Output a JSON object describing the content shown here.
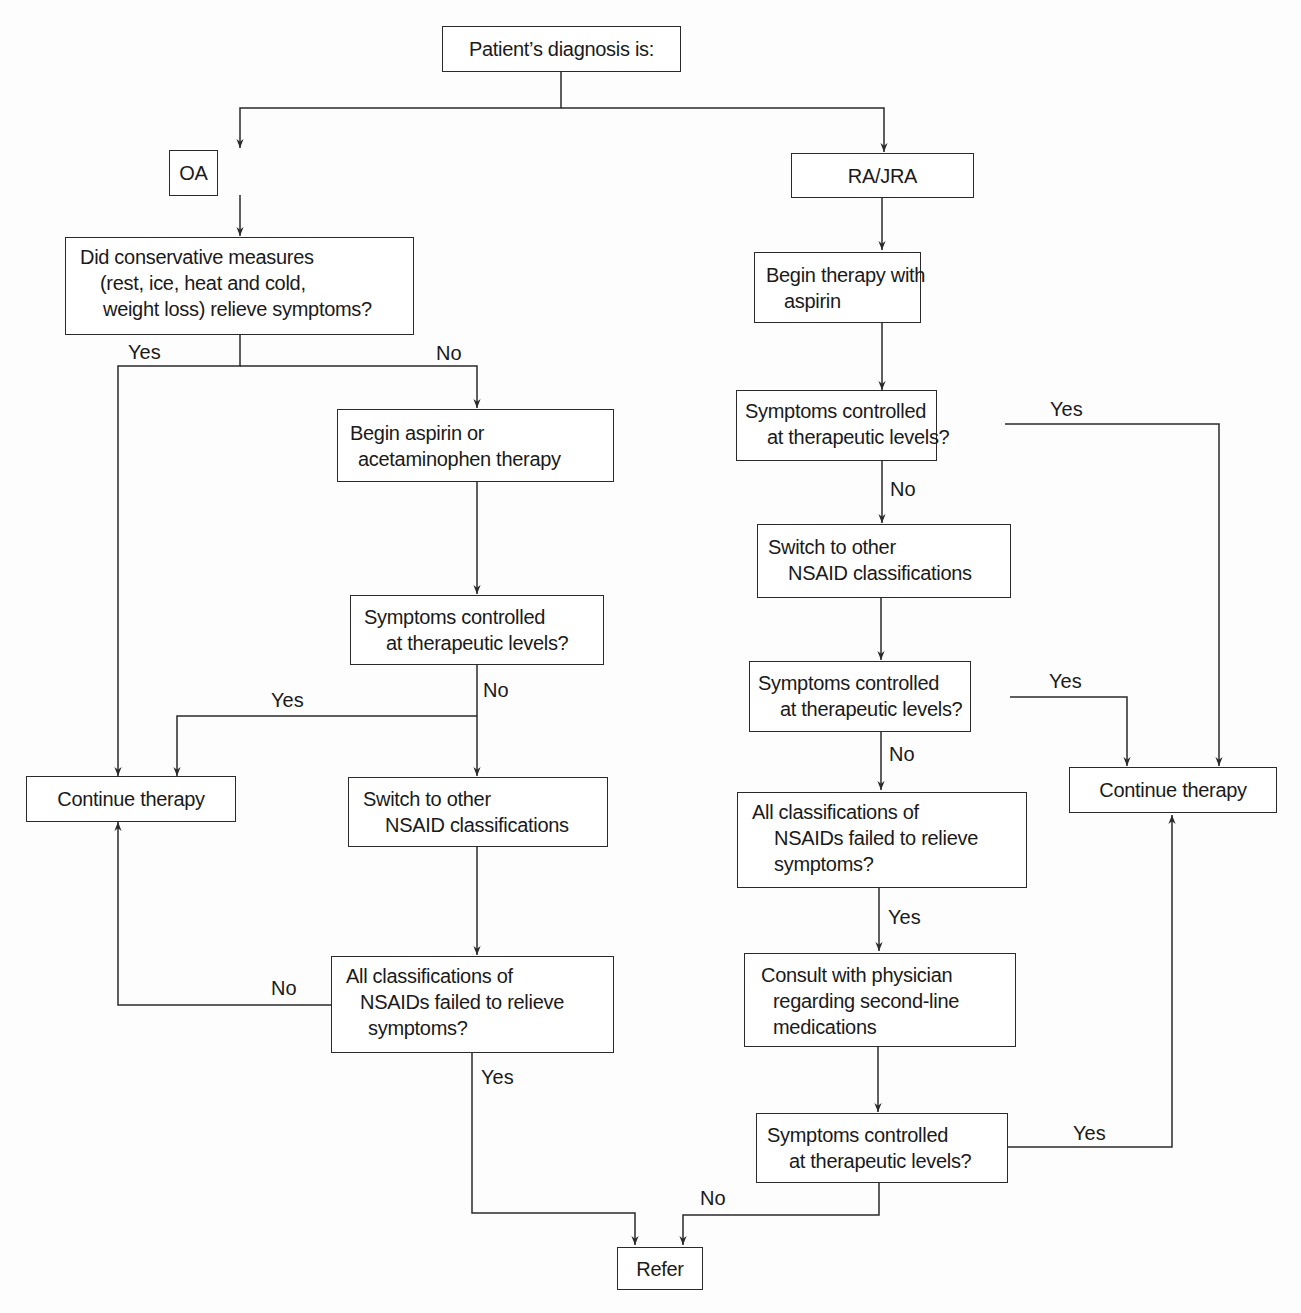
{
  "nodes": {
    "root": "Patient’s diagnosis is:",
    "oa": "OA",
    "ra": "RA/JRA",
    "oa_conservative": [
      "Did conservative measures",
      "(rest, ice, heat and cold,",
      "weight loss) relieve symptoms?"
    ],
    "oa_begin_aspirin": [
      "Begin aspirin or",
      "acetaminophen therapy"
    ],
    "oa_controlled": [
      "Symptoms controlled",
      "at therapeutic levels?"
    ],
    "oa_continue": "Continue therapy",
    "oa_switch": [
      "Switch to other",
      "NSAID classifications"
    ],
    "oa_all_failed": [
      "All classifications of",
      "NSAIDs failed to relieve",
      "symptoms?"
    ],
    "ra_begin_aspirin": [
      "Begin therapy with",
      "aspirin"
    ],
    "ra_controlled_1": [
      "Symptoms controlled",
      "at therapeutic levels?"
    ],
    "ra_switch": [
      "Switch to other",
      "NSAID classifications"
    ],
    "ra_controlled_2": [
      "Symptoms controlled",
      "at therapeutic levels?"
    ],
    "ra_all_failed": [
      "All classifications of",
      "NSAIDs failed to relieve",
      "symptoms?"
    ],
    "ra_consult": [
      "Consult with physician",
      "regarding second-line",
      "medications"
    ],
    "ra_controlled_3": [
      "Symptoms controlled",
      "at therapeutic levels?"
    ],
    "ra_continue": "Continue therapy",
    "refer": "Refer"
  },
  "edge_labels": {
    "oa_conservative_yes": "Yes",
    "oa_conservative_no": "No",
    "oa_controlled_yes": "Yes",
    "oa_controlled_no": "No",
    "oa_all_failed_no": "No",
    "oa_all_failed_yes": "Yes",
    "ra_controlled_1_yes": "Yes",
    "ra_controlled_1_no": "No",
    "ra_controlled_2_yes": "Yes",
    "ra_controlled_2_no": "No",
    "ra_all_failed_yes": "Yes",
    "ra_controlled_3_yes": "Yes",
    "ra_controlled_3_no": "No"
  },
  "colors": {
    "stroke": "#2a2a2a",
    "text": "#1a1a1a",
    "background": "#fdfdfd"
  }
}
